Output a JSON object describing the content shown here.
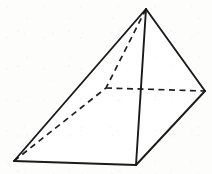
{
  "figure": {
    "shape_type": "square-pyramid",
    "projection": "oblique",
    "canvas": {
      "width": 212,
      "height": 174,
      "background": "#fdfdfc"
    },
    "style": {
      "visible_edge_color": "#1a1a1a",
      "hidden_edge_color": "#1f1f1f",
      "face_color": "#ffffff",
      "visible_stroke_width": 1.9,
      "hidden_stroke_width": 1.7,
      "hidden_dash_pattern": "6 4.5"
    },
    "vertices": {
      "apex": {
        "label": "apex",
        "x": 146,
        "y": 9,
        "hidden": false
      },
      "base_left": {
        "label": "base-left-corner",
        "x": 14,
        "y": 161,
        "hidden": false
      },
      "base_front": {
        "label": "base-front-corner",
        "x": 136,
        "y": 165,
        "hidden": false
      },
      "base_right": {
        "label": "base-right-corner",
        "x": 205,
        "y": 91,
        "hidden": false
      },
      "base_back": {
        "label": "base-back-corner",
        "x": 106,
        "y": 88,
        "hidden": true
      }
    },
    "edges": [
      {
        "name": "apex-to-base-left",
        "from": "apex",
        "to": "base_left",
        "hidden": false,
        "path": "M 146 9 L 14 161"
      },
      {
        "name": "apex-to-base-front",
        "from": "apex",
        "to": "base_front",
        "hidden": false,
        "path": "M 146 9 L 136 165"
      },
      {
        "name": "apex-to-base-right",
        "from": "apex",
        "to": "base_right",
        "hidden": false,
        "path": "M 146 9 L 205 91"
      },
      {
        "name": "base-left-to-front",
        "from": "base_left",
        "to": "base_front",
        "hidden": false,
        "path": "M 14 161 L 136 165"
      },
      {
        "name": "base-front-to-right",
        "from": "base_front",
        "to": "base_right",
        "hidden": false,
        "path": "M 136 165 L 205 91"
      },
      {
        "name": "apex-to-base-back",
        "from": "apex",
        "to": "base_back",
        "hidden": true,
        "path": "M 146 9 L 106 88"
      },
      {
        "name": "base-left-to-back",
        "from": "base_left",
        "to": "base_back",
        "hidden": true,
        "path": "M 14 161 L 106 88"
      },
      {
        "name": "base-back-to-right",
        "from": "base_back",
        "to": "base_right",
        "hidden": true,
        "path": "M 106 88 L 205 91"
      }
    ],
    "faces": [
      {
        "name": "front-left-face",
        "path": "M 146 9 L 14 161 L 136 165 Z",
        "visible": true
      },
      {
        "name": "front-right-face",
        "path": "M 146 9 L 136 165 L 205 91 Z",
        "visible": true
      }
    ]
  }
}
